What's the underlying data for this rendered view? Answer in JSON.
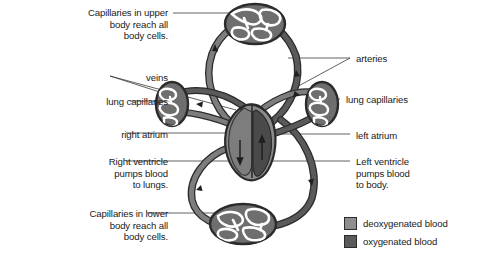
{
  "figure": {
    "background_color": "#ffffff"
  },
  "labels": {
    "capillaries_upper": "Capillaries in upper\nbody reach all\nbody cells.",
    "veins": "veins",
    "lung_capillaries_left": "lung capillaries",
    "right_atrium": "right atrium",
    "right_ventricle": "Right ventricle\npumps blood\nto lungs.",
    "capillaries_lower": "Capillaries in lower\nbody reach all\nbody cells.",
    "arteries": "arteries",
    "lung_capillaries_right": "lung capillaries",
    "left_atrium": "left atrium",
    "left_ventricle": "Left ventricle\npumps blood\nto body."
  },
  "legend": {
    "items": [
      {
        "label": "deoxygenated blood",
        "color": "#8e8e8e"
      },
      {
        "label": "oxygenated blood",
        "color": "#5a5a5a"
      }
    ]
  },
  "colors": {
    "deoxygenated": "#8e8e8e",
    "oxygenated": "#5a5a5a",
    "vessel_outline": "#2b2b2b",
    "leader_line": "#3a3a3a",
    "text": "#1a1a1a",
    "heart_muscle": "#7d7d7d",
    "heart_chamber_dark": "#4a4a4a"
  }
}
